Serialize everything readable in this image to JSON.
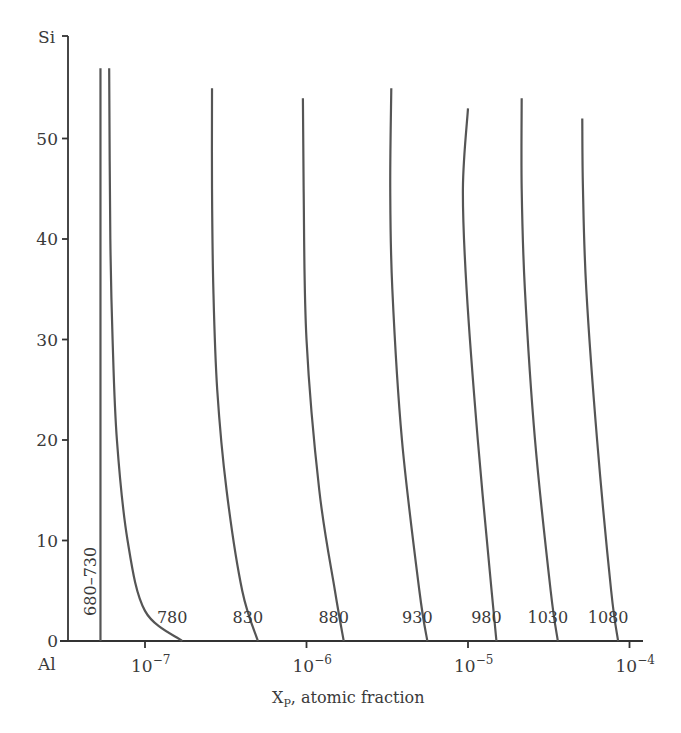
{
  "chart_data": {
    "type": "line",
    "title": "",
    "xlabel": "X_P, atomic fraction",
    "xlabel_main": "X",
    "xlabel_sub": "P",
    "xlabel_rest": ", atomic fraction",
    "ylabel_top": "Si",
    "xlabel_origin": "Al",
    "xscale": "log",
    "xlim": [
      2.8e-08,
      0.00011
    ],
    "ylim": [
      0,
      57
    ],
    "x_ticks": [
      {
        "base": "10",
        "exp": "−7",
        "value": 1e-07
      },
      {
        "base": "10",
        "exp": "−6",
        "value": 1e-06
      },
      {
        "base": "10",
        "exp": "−5",
        "value": 1e-05
      },
      {
        "base": "10",
        "exp": "−4",
        "value": 0.0001
      }
    ],
    "y_ticks": [
      "0",
      "10",
      "20",
      "30",
      "40",
      "50"
    ],
    "grid": false,
    "legend": "none (curves labeled inline with temperatures)",
    "series": [
      {
        "name": "680–730",
        "label": "680–730",
        "points": [
          [
            5.3e-08,
            0
          ],
          [
            5.3e-08,
            10
          ],
          [
            5.3e-08,
            30
          ],
          [
            5.3e-08,
            57
          ]
        ]
      },
      {
        "name": "780",
        "label": "780",
        "points": [
          [
            1.7e-07,
            0
          ],
          [
            1e-07,
            3
          ],
          [
            7.8e-08,
            10
          ],
          [
            6.7e-08,
            20
          ],
          [
            6.3e-08,
            30
          ],
          [
            6.1e-08,
            40
          ],
          [
            6e-08,
            57
          ]
        ]
      },
      {
        "name": "830",
        "label": "830",
        "points": [
          [
            5e-07,
            0
          ],
          [
            4e-07,
            5
          ],
          [
            3.2e-07,
            15
          ],
          [
            2.8e-07,
            25
          ],
          [
            2.65e-07,
            35
          ],
          [
            2.6e-07,
            45
          ],
          [
            2.6e-07,
            55
          ]
        ]
      },
      {
        "name": "880",
        "label": "880",
        "points": [
          [
            1.7e-06,
            0
          ],
          [
            1.5e-06,
            5
          ],
          [
            1.2e-06,
            15
          ],
          [
            1e-06,
            30
          ],
          [
            9.6e-07,
            45
          ],
          [
            9.5e-07,
            54
          ]
        ]
      },
      {
        "name": "930",
        "label": "930",
        "points": [
          [
            5.6e-06,
            0
          ],
          [
            5e-06,
            5
          ],
          [
            3.9e-06,
            20
          ],
          [
            3.4e-06,
            35
          ],
          [
            3.3e-06,
            45
          ],
          [
            3.35e-06,
            55
          ]
        ]
      },
      {
        "name": "980",
        "label": "980",
        "points": [
          [
            1.5e-05,
            0
          ],
          [
            1.4e-05,
            5
          ],
          [
            1.15e-05,
            20
          ],
          [
            9.8e-06,
            35
          ],
          [
            9.3e-06,
            45
          ],
          [
            1e-05,
            53
          ]
        ]
      },
      {
        "name": "1030",
        "label": "1030",
        "points": [
          [
            3.6e-05,
            0
          ],
          [
            3.25e-05,
            5
          ],
          [
            2.6e-05,
            20
          ],
          [
            2.25e-05,
            35
          ],
          [
            2.15e-05,
            45
          ],
          [
            2.15e-05,
            54
          ]
        ]
      },
      {
        "name": "1080",
        "label": "1080",
        "points": [
          [
            8.5e-05,
            0
          ],
          [
            7.7e-05,
            5
          ],
          [
            6.3e-05,
            20
          ],
          [
            5.4e-05,
            35
          ],
          [
            5.15e-05,
            45
          ],
          [
            5.1e-05,
            52
          ]
        ]
      }
    ]
  }
}
